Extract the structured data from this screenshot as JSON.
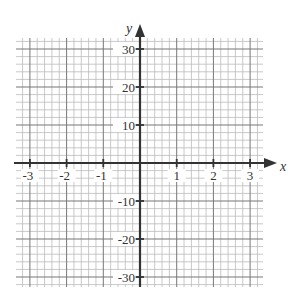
{
  "chart_data": {
    "type": "line",
    "title": "",
    "xlabel": "x",
    "ylabel": "y",
    "xlim": [
      -3.35,
      3.35
    ],
    "ylim": [
      -33,
      33
    ],
    "grid": true,
    "minor_divisions_per_major": 5,
    "x_ticks": [
      -3,
      -2,
      -1,
      1,
      2,
      3
    ],
    "x_tick_labels": [
      "-3",
      "-2",
      "-1",
      "1",
      "2",
      "3"
    ],
    "y_ticks": [
      30,
      20,
      10,
      -10,
      -20,
      -30
    ],
    "y_tick_labels": [
      "30",
      "20",
      "10",
      "-10",
      "-20",
      "-30"
    ],
    "series": [],
    "legend": null
  },
  "colors": {
    "axis": "#333333",
    "major_grid": "#777777",
    "minor_grid": "#bbbbbb",
    "background": "#ffffff"
  },
  "layout": {
    "grid_left": 16,
    "grid_right": 263,
    "grid_top": 38,
    "grid_bottom": 287,
    "origin_x": 140,
    "origin_y": 163,
    "px_per_x_unit": 36.7,
    "px_per_10_y": 38
  }
}
